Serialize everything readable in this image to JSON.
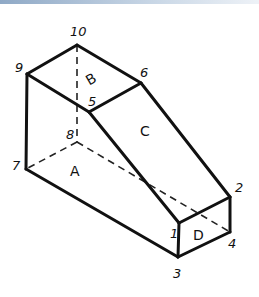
{
  "diagram": {
    "vertices": [
      {
        "id": "1",
        "label": "1",
        "x": 179,
        "y": 223,
        "lx": 170,
        "ly": 238
      },
      {
        "id": "2",
        "label": "2",
        "x": 230,
        "y": 197,
        "lx": 235,
        "ly": 192
      },
      {
        "id": "3",
        "label": "3",
        "x": 178,
        "y": 257,
        "lx": 173,
        "ly": 278
      },
      {
        "id": "4",
        "label": "4",
        "x": 230,
        "y": 232,
        "lx": 228,
        "ly": 248
      },
      {
        "id": "5",
        "label": "5",
        "x": 89,
        "y": 112,
        "lx": 88,
        "ly": 106
      },
      {
        "id": "6",
        "label": "6",
        "x": 141,
        "y": 83,
        "lx": 140,
        "ly": 77
      },
      {
        "id": "7",
        "label": "7",
        "x": 26,
        "y": 169,
        "lx": 12,
        "ly": 170
      },
      {
        "id": "8",
        "label": "8",
        "x": 77,
        "y": 142,
        "lx": 66,
        "ly": 139
      },
      {
        "id": "9",
        "label": "9",
        "x": 27,
        "y": 74,
        "lx": 15,
        "ly": 72
      },
      {
        "id": "10",
        "label": "10",
        "x": 77,
        "y": 45,
        "lx": 70,
        "ly": 36
      }
    ],
    "faces": [
      {
        "id": "A",
        "label": "A",
        "x": 70,
        "y": 176
      },
      {
        "id": "B",
        "label": "B",
        "x": 86,
        "y": 84
      },
      {
        "id": "C",
        "label": "C",
        "x": 140,
        "y": 136
      },
      {
        "id": "D",
        "label": "D",
        "x": 193,
        "y": 240
      }
    ],
    "visible_edges": [
      [
        "9",
        "10"
      ],
      [
        "10",
        "6"
      ],
      [
        "6",
        "5"
      ],
      [
        "5",
        "9"
      ],
      [
        "9",
        "7"
      ],
      [
        "7",
        "3"
      ],
      [
        "5",
        "1"
      ],
      [
        "6",
        "2"
      ],
      [
        "1",
        "2"
      ],
      [
        "1",
        "3"
      ],
      [
        "3",
        "4"
      ],
      [
        "4",
        "2"
      ]
    ],
    "hidden_edges": [
      [
        "10",
        "8"
      ],
      [
        "8",
        "7"
      ],
      [
        "8",
        "4"
      ]
    ]
  }
}
